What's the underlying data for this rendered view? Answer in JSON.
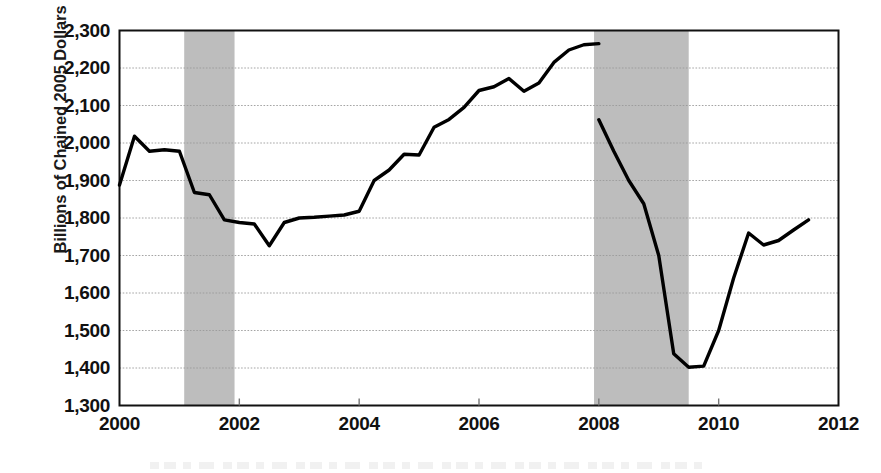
{
  "chart_data": {
    "type": "line",
    "title": "",
    "subtitle": "",
    "xlabel": "",
    "ylabel": "Billions of Chained 2005 Dollars",
    "xlim": [
      2000,
      2012
    ],
    "ylim": [
      1300,
      2300
    ],
    "grid": true,
    "legend": null,
    "x_ticks": [
      2000,
      2002,
      2004,
      2006,
      2008,
      2010,
      2012
    ],
    "x_tick_labels": [
      "2000",
      "2002",
      "2004",
      "2006",
      "2008",
      "2010",
      "2012"
    ],
    "y_ticks": [
      1300,
      1400,
      1500,
      1600,
      1700,
      1800,
      1900,
      2000,
      2100,
      2200,
      2300
    ],
    "y_tick_labels": [
      "1,300",
      "1,400",
      "1,500",
      "1,600",
      "1,700",
      "1,800",
      "1,900",
      "2,000",
      "2,100",
      "2,200",
      "2,300"
    ],
    "series": [
      {
        "name": "Real Private Nonresidential Fixed Investment",
        "color": "#000000",
        "x": [
          2000.0,
          2000.25,
          2000.5,
          2000.75,
          2001.0,
          2001.25,
          2001.5,
          2001.75,
          2002.0,
          2002.25,
          2002.5,
          2002.75,
          2003.0,
          2003.25,
          2003.5,
          2003.75,
          2004.0,
          2004.25,
          2004.5,
          2004.75,
          2005.0,
          2005.25,
          2005.5,
          2005.75,
          2006.0,
          2006.25,
          2006.5,
          2006.75,
          2007.0,
          2007.25,
          2007.5,
          2007.75,
          2008.0,
          2008.25,
          2008.5,
          2008.75,
          2009.0,
          2009.25,
          2009.5,
          2009.75,
          2010.0,
          2010.25,
          2010.5,
          2010.75,
          2011.0,
          2011.25,
          2011.5
        ],
        "values": [
          1888,
          2018,
          1978,
          1982,
          1978,
          1868,
          1862,
          1795,
          1788,
          1784,
          1726,
          1788,
          1800,
          1802,
          1805,
          1808,
          1818,
          1900,
          1928,
          1970,
          1968,
          2042,
          2063,
          2095,
          2140,
          2150,
          2172,
          2138,
          2160,
          2215,
          2248,
          2262,
          2265,
          2265,
          2250,
          2225,
          2190,
          2160,
          2172,
          2198,
          2182,
          2130,
          2068,
          2062,
          1978,
          1900,
          1838
        ]
      }
    ],
    "series_tail": {
      "x": [
        2008.0,
        2008.25,
        2008.5,
        2008.75,
        2009.0,
        2009.25,
        2009.5,
        2009.75,
        2010.0,
        2010.25,
        2010.5,
        2010.75,
        2011.0,
        2011.25,
        2011.5
      ],
      "values": [
        2062,
        1978,
        1900,
        1838,
        1700,
        1438,
        1402,
        1405,
        1500,
        1640,
        1760,
        1728,
        1740,
        1768,
        1795
      ]
    },
    "recession_bands": [
      {
        "label": "2001 recession",
        "start": 2001.08,
        "end": 2001.92,
        "color": "#bdbdbd"
      },
      {
        "label": "Great Recession",
        "start": 2007.92,
        "end": 2009.5,
        "color": "#bdbdbd"
      }
    ],
    "notes": {
      "peak_value": 2265,
      "peak_year": 2006.1,
      "trough_value": 1402,
      "trough_year": 2009.5,
      "start_value": 1888,
      "end_value": 1795
    }
  },
  "style": {
    "axis_color": "#111111",
    "grid_color": "#9a9a9a",
    "line_color": "#111111",
    "band_color": "#bdbdbd",
    "background": "#ffffff"
  }
}
